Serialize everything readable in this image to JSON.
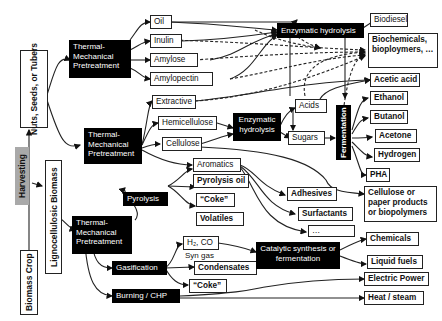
{
  "diagram": {
    "sources": {
      "biomass_crop": "Biomass Crop",
      "harvesting": "Harvesting",
      "nuts_seeds_tubers": "Nuts, Seeds, or Tubers",
      "lignocellulosic": "Lignocellulosic Biomass"
    },
    "processes": {
      "tmp_top": "Thermal-Mechanical Pretreatment",
      "tmp_mid": "Thermal-Mechanical Pretreatment",
      "tmp_bottom": "Thermal-Mechanical Pretreatment",
      "enzymatic_hydrolysis_top": "Enzymatic hydrolysis",
      "enzymatic_hydrolysis_mid": "Enzymatic hydrolysis",
      "fermentation": "Fermentation",
      "pyrolysis": "Pyrolysis",
      "gasification": "Gasification",
      "burning_chp": "Burning / CHP",
      "catalytic": "Catalytic synthesis or fermentation"
    },
    "intermediates": {
      "oil": "Oil",
      "inulin": "Inulin",
      "amylose": "Amylose",
      "amylopectin": "Amylopectin",
      "extractive": "Extractive",
      "hemicellulose": "Hemicellulose",
      "cellulose": "Cellulose",
      "aromatics": "Aromatics",
      "acids": "Acids",
      "sugars": "Sugars",
      "pyrolysis_oil": "Pyrolysis oil",
      "coke_pyro": "“Coke”",
      "volatiles": "Volatiles",
      "h2_co": "H₂, CO",
      "syn_gas": "Syn gas",
      "condensates": "Condensates",
      "coke_gas": "“Coke”"
    },
    "products": {
      "biodiesel": "Biodiesel",
      "biochemicals": "Biochemicals, bioploymers, …",
      "acetic_acid": "Acetic acid",
      "ethanol": "Ethanol",
      "butanol": "Butanol",
      "acetone": "Acetone",
      "hydrogen": "Hydrogen",
      "pha": "PHA",
      "cellulose_paper": "Cellulose or paper products or biopolymers",
      "adhesives": "Adhesives",
      "surfactants": "Surfactants",
      "ellipsis": "…",
      "chemicals": "Chemicals",
      "liquid_fuels": "Liquid fuels",
      "electric_power": "Electric Power",
      "heat_steam": "Heat / steam"
    },
    "colors": {
      "process_fill": "#000000",
      "harvesting_fill": "#a9a9a9",
      "line": "#222222"
    }
  }
}
